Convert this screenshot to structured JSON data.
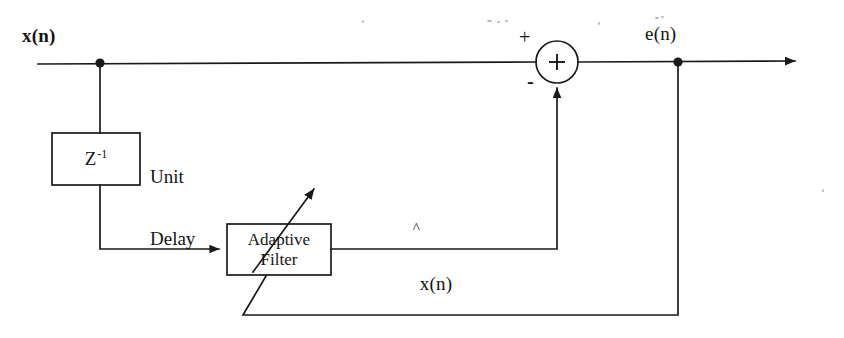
{
  "diagram": {
    "canvas": {
      "width": 844,
      "height": 338,
      "background": "#ffffff"
    },
    "ink_color": "#1a1a1a",
    "labels": {
      "input_signal": "x(n)",
      "error_signal": "e(n)",
      "predicted_signal": "x(n)",
      "predicted_signal_hat": "^",
      "delay_block": "Z",
      "delay_block_exponent": "-1",
      "delay_caption_line1": "Unit",
      "delay_caption_line2": "Delay",
      "filter_line1": "Adaptive",
      "filter_line2": "Filter",
      "summer_symbol": "+",
      "summer_positive_sign": "+",
      "summer_negative_sign": "-"
    },
    "blocks": [
      {
        "name": "unit-delay",
        "label": "Z-1",
        "x": 52,
        "y": 133,
        "w": 88,
        "h": 52
      },
      {
        "name": "adaptive-filter",
        "label": "Adaptive Filter",
        "x": 227,
        "y": 224,
        "w": 104,
        "h": 51
      }
    ],
    "nodes": [
      {
        "name": "input-tap-node",
        "x": 100,
        "y": 62
      },
      {
        "name": "error-tap-node",
        "x": 678,
        "y": 62
      }
    ],
    "summer": {
      "name": "summing-junction",
      "cx": 557,
      "cy": 62,
      "r": 21
    }
  }
}
